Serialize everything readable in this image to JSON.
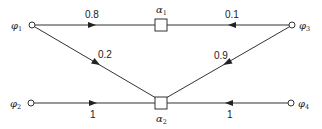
{
  "diagram": {
    "type": "flow-graph",
    "nodes": {
      "phi1": {
        "symbol": "φ",
        "sub": "1",
        "kind": "source-circle"
      },
      "phi2": {
        "symbol": "φ",
        "sub": "2",
        "kind": "source-circle"
      },
      "phi3": {
        "symbol": "φ",
        "sub": "3",
        "kind": "source-circle"
      },
      "phi4": {
        "symbol": "φ",
        "sub": "4",
        "kind": "source-circle"
      },
      "alpha1": {
        "symbol": "α",
        "sub": "1",
        "kind": "box"
      },
      "alpha2": {
        "symbol": "α",
        "sub": "2",
        "kind": "box"
      }
    },
    "edges": [
      {
        "from": "phi1",
        "to": "alpha1",
        "weight": "0.8"
      },
      {
        "from": "phi3",
        "to": "alpha1",
        "weight": "0.1"
      },
      {
        "from": "phi1",
        "to": "alpha2",
        "weight": "0.2"
      },
      {
        "from": "phi3",
        "to": "alpha2",
        "weight": "0.9"
      },
      {
        "from": "phi2",
        "to": "alpha2",
        "weight": "1"
      },
      {
        "from": "phi4",
        "to": "alpha2",
        "weight": "1"
      }
    ],
    "colors": {
      "line": "#333333",
      "text": "#1a1a1a",
      "background": "#ffffff"
    }
  }
}
